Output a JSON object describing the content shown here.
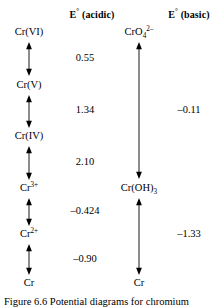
{
  "figure": {
    "headers": {
      "acidic": "E° (acidic)",
      "basic": "E° (basic)"
    }
  },
  "acidic_column": {
    "species": [
      {
        "label": "Cr(VI)",
        "html": "Cr(VI)"
      },
      {
        "label": "Cr(V)",
        "html": "Cr(V)"
      },
      {
        "label": "Cr(IV)",
        "html": "Cr(IV)"
      },
      {
        "label": "Cr3+",
        "html": "Cr<sup>3+</sup>"
      },
      {
        "label": "Cr2+",
        "html": "Cr<sup>2+</sup>"
      },
      {
        "label": "Cr",
        "html": "Cr"
      }
    ],
    "potentials": [
      "0.55",
      "1.34",
      "2.10",
      "–0.424",
      "–0.90"
    ]
  },
  "basic_column": {
    "species": [
      {
        "label": "CrO42-",
        "html": "CrO<sub>4</sub><sup>2–</sup>"
      },
      {
        "label": "Cr(OH)3",
        "html": "Cr(OH)<sub>3</sub>"
      },
      {
        "label": "Cr",
        "html": "Cr"
      }
    ],
    "potentials": [
      "–0.11",
      "–1.33"
    ]
  },
  "caption": "Figure 6.6  Potential diagrams for chromium",
  "colors": {
    "ink": "#000000",
    "background": "#ffffff"
  }
}
